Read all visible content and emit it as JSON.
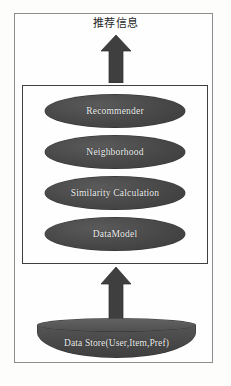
{
  "diagram": {
    "top_label": "推荐信息",
    "arrows": [
      {
        "name": "recommendation-output-arrow",
        "direction": "up"
      },
      {
        "name": "data-input-arrow",
        "direction": "up"
      }
    ],
    "engine_box": {
      "nodes": [
        {
          "label": "Recommender"
        },
        {
          "label": "Neighborhood"
        },
        {
          "label": "Similarity Calculation"
        },
        {
          "label": "DataModel"
        }
      ]
    },
    "datastore": {
      "label": "Data Store(User,Item,Pref)"
    },
    "colors": {
      "node_fill": "#474747",
      "node_text": "#f2f2f2",
      "datastore_fill": "#4b4b4b",
      "frame_border": "#8d8d8d",
      "inner_border": "#3f3f3f",
      "arrow_fill": "#3f3f3f",
      "background": "#fdfdfc"
    }
  }
}
